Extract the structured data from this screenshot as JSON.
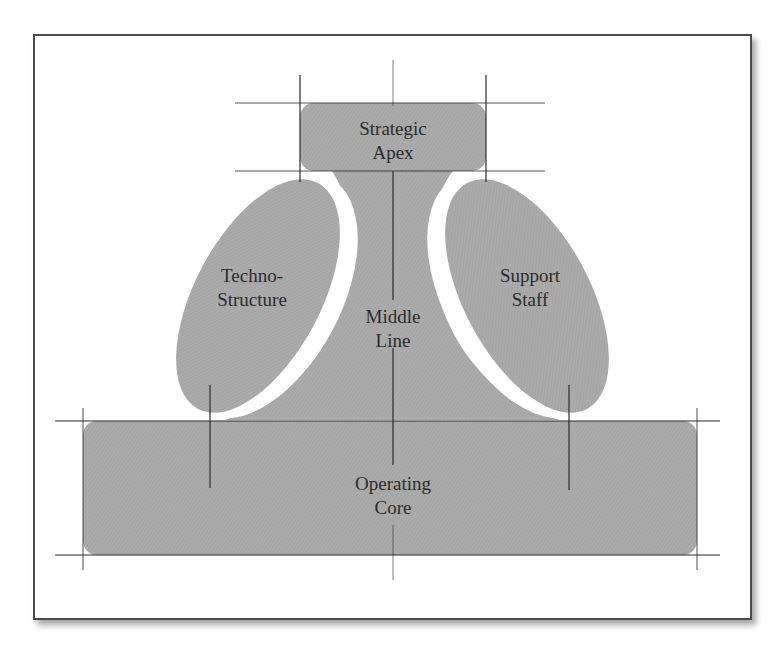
{
  "diagram": {
    "type": "organizational-structure",
    "fill_color": "#a9a9a9",
    "line_color": "#2a2a2a",
    "parts": [
      {
        "id": "strategic-apex",
        "lines": [
          "Strategic",
          "Apex"
        ]
      },
      {
        "id": "techno-structure",
        "lines": [
          "Techno-",
          "Structure"
        ]
      },
      {
        "id": "middle-line",
        "lines": [
          "Middle",
          "Line"
        ]
      },
      {
        "id": "support-staff",
        "lines": [
          "Support",
          "Staff"
        ]
      },
      {
        "id": "operating-core",
        "lines": [
          "Operating",
          "Core"
        ]
      }
    ]
  }
}
